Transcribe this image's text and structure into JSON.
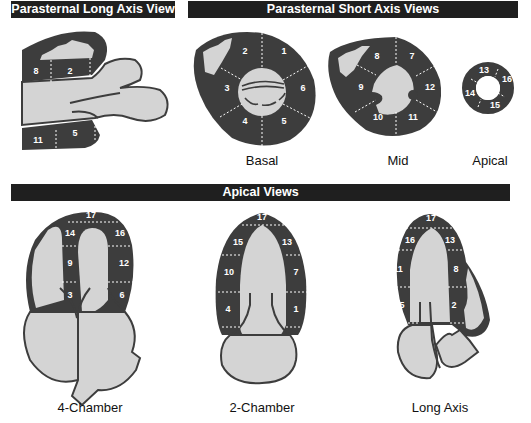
{
  "headers": {
    "plax": "Parasternal Long Axis View",
    "psax": "Parasternal Short Axis Views",
    "apical": "Apical Views"
  },
  "captions": {
    "basal": "Basal",
    "mid": "Mid",
    "apical_sax": "Apical",
    "four_chamber": "4-Chamber",
    "two_chamber": "2-Chamber",
    "long_axis": "Long Axis"
  },
  "colors": {
    "bar": "#1f1f1f",
    "myocardium": "#3d3d3d",
    "cavity": "#d4d4d4",
    "label": "#ffffff"
  },
  "segments": {
    "plax": [
      "8",
      "2",
      "11",
      "5"
    ],
    "basal": [
      "1",
      "2",
      "3",
      "4",
      "5",
      "6"
    ],
    "mid": [
      "7",
      "8",
      "9",
      "10",
      "11",
      "12"
    ],
    "apical_sax": [
      "13",
      "14",
      "15",
      "16"
    ],
    "four_chamber": [
      "17",
      "14",
      "16",
      "9",
      "12",
      "3",
      "6"
    ],
    "two_chamber": [
      "17",
      "15",
      "13",
      "10",
      "7",
      "4",
      "1"
    ],
    "long_axis": [
      "17",
      "16",
      "13",
      "11",
      "8",
      "5",
      "2"
    ]
  }
}
